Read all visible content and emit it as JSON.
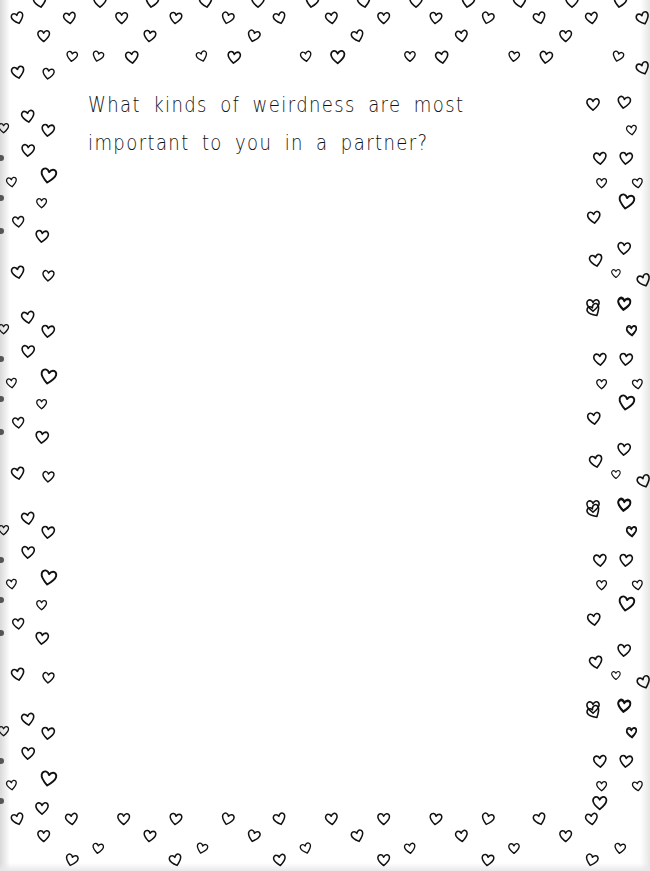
{
  "page": {
    "prompt": "What kinds of weirdness are most important to you in a partner?",
    "background_color": "#ffffff",
    "ink_color": "#111111",
    "border_motif": "heart-icon"
  }
}
